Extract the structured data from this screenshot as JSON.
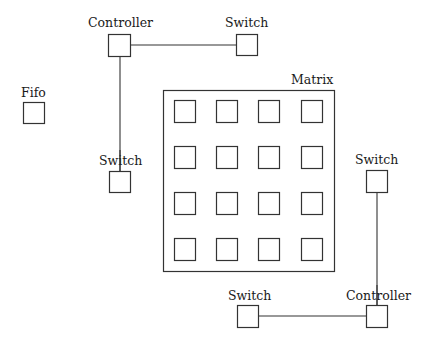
{
  "diagram": {
    "type": "block-diagram",
    "components": {
      "controller_top": {
        "label": "Controller"
      },
      "switch_top_right": {
        "label": "Switch"
      },
      "fifo": {
        "label": "Fifo"
      },
      "switch_left": {
        "label": "Switch"
      },
      "matrix": {
        "label": "Matrix",
        "rows": 4,
        "cols": 4
      },
      "switch_right": {
        "label": "Switch"
      },
      "switch_bottom": {
        "label": "Switch"
      },
      "controller_bottom": {
        "label": "Controller"
      }
    },
    "connections": [
      {
        "from": "Controller (top)",
        "to": "Switch (top right)"
      },
      {
        "from": "Controller (top)",
        "to": "Switch (left)"
      },
      {
        "from": "Switch (right)",
        "to": "Controller (bottom)"
      },
      {
        "from": "Switch (bottom)",
        "to": "Controller (bottom)"
      }
    ]
  }
}
